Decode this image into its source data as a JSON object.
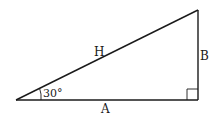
{
  "diagram": {
    "type": "right-triangle",
    "labels": {
      "hypotenuse": "H",
      "vertical_leg": "B",
      "horizontal_leg": "A",
      "angle": "30°"
    },
    "colors": {
      "stroke": "#1a1a1a",
      "background": "#ffffff"
    }
  }
}
